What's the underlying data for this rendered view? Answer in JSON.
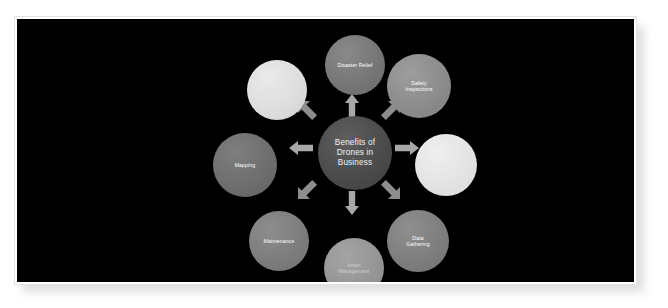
{
  "slide": {
    "background_color": "#000000",
    "frame_color": "#ffffff"
  },
  "diagram": {
    "type": "radial-hub-and-spoke",
    "hub": {
      "label": "Benefits of\nDrones in\nBusiness",
      "color": "#4a4a4a",
      "text_color": "#f2f2f2"
    },
    "arrow_color": "#a8a8a8",
    "arrow_count": 8,
    "arrow_directions": [
      "up",
      "up-right",
      "right",
      "down-right",
      "down",
      "down-left",
      "left",
      "up-left"
    ],
    "nodes": [
      {
        "id": "disaster-relief",
        "label": "Disaster Relief",
        "position": "top",
        "color": "#747474",
        "text_color": "#ffffff"
      },
      {
        "id": "safety-inspections",
        "label": "Safety\nInspections",
        "position": "top-right",
        "color": "#8a8a8a",
        "text_color": "#ffffff"
      },
      {
        "id": "delivery",
        "label": "Delivery",
        "position": "right",
        "color": "#e2e2e2",
        "text_color": "#e9e9e9"
      },
      {
        "id": "data-gathering",
        "label": "Data\nGathering",
        "position": "bottom-right",
        "color": "#7c7c7c",
        "text_color": "#ffffff"
      },
      {
        "id": "asset-management",
        "label": "Asset\nManagement",
        "position": "bottom",
        "color": "#949494",
        "text_color": "#cfcfcf"
      },
      {
        "id": "maintenance",
        "label": "Maintenance",
        "position": "bottom-left",
        "color": "#7b7b7b",
        "text_color": "#ffffff"
      },
      {
        "id": "mapping",
        "label": "Mapping",
        "position": "left",
        "color": "#6c6c6c",
        "text_color": "#ffffff"
      },
      {
        "id": "surveying",
        "label": "Surveying",
        "position": "top-left",
        "color": "#dcdcdc",
        "text_color": "#e4e4e4"
      }
    ]
  }
}
